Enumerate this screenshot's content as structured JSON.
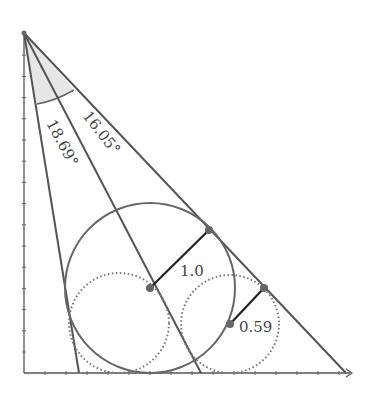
{
  "diagram": {
    "angle_labels": [
      "18.69°",
      "16.05°"
    ],
    "radius_labels": [
      "1.0",
      "0.59"
    ],
    "colors": {
      "line": "#555555",
      "wedge_fill": "#e6e6e6",
      "point": "#666666",
      "radius_segment": "#222222"
    }
  }
}
